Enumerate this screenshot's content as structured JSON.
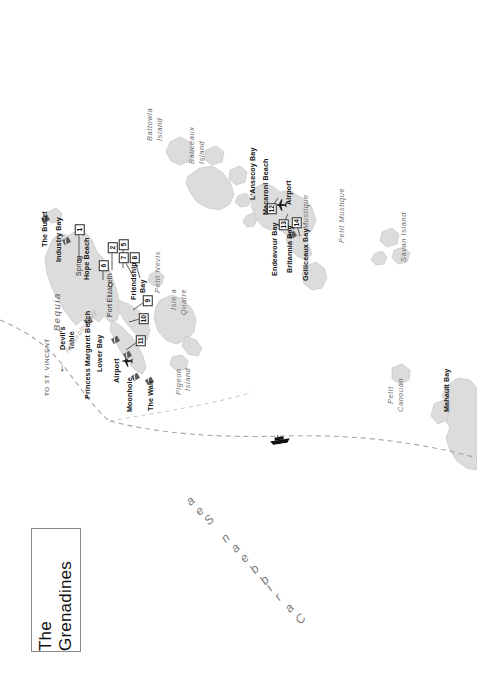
{
  "document": {
    "type": "tourist-map",
    "title": "The Grenadines",
    "orientation_note": "map rendered rotated 90 degrees counter-clockwise"
  },
  "title_box": {
    "label": "The Grenadines"
  },
  "ocean_label": {
    "text": "Caribbean Sea"
  },
  "route": {
    "direction_label": "TO ST. VINCENT",
    "arrow_icon": "arrow-left-icon",
    "ferry_icon": "ferry-boat-icon",
    "line_style": "dashed"
  },
  "islands": [
    {
      "id": "bequia",
      "name": "Bequia",
      "style": "large-italic"
    },
    {
      "id": "battowia",
      "name": "Battowia\nIsland",
      "style": "italic"
    },
    {
      "id": "baliceaux",
      "name": "Baliceaux\nIsland",
      "style": "italic"
    },
    {
      "id": "mustique",
      "name": "Mustique",
      "style": "italic"
    },
    {
      "id": "petit-mustique",
      "name": "Petit Mustique",
      "style": "italic"
    },
    {
      "id": "savan",
      "name": "Savan Island",
      "style": "italic"
    },
    {
      "id": "petit-canouan",
      "name": "Petit\nCanouan",
      "style": "italic"
    },
    {
      "id": "petit-nevis",
      "name": "Petit Nevis",
      "style": "italic"
    },
    {
      "id": "isle-a-quatre",
      "name": "Isle a\nQuatre",
      "style": "italic"
    },
    {
      "id": "pigeon-island",
      "name": "Pigeon\nIsland",
      "style": "italic"
    }
  ],
  "bays": [
    {
      "id": "admiralty-bay",
      "name": "Admiralty Bay"
    }
  ],
  "places": [
    {
      "id": "port-elizabeth",
      "name": "Port Elizabeth",
      "marker": "town-circle"
    },
    {
      "id": "spring",
      "name": "Spring",
      "marker": "town-circle"
    }
  ],
  "dive_sites": [
    {
      "id": "the-bullet",
      "name": "The Bullet",
      "icon": "dive-flag-icon"
    },
    {
      "id": "industry-bay",
      "name": "Industry Bay",
      "icon": "dive-flag-icon"
    },
    {
      "id": "devils-table",
      "name": "Devil's Table",
      "icon": "dive-flag-icon"
    },
    {
      "id": "princess-margaret-beach",
      "name": "Princess Margaret Beach",
      "icon": "dive-flag-icon"
    },
    {
      "id": "lower-bay",
      "name": "Lower Bay",
      "icon": "dive-flag-icon"
    },
    {
      "id": "moonhole",
      "name": "Moonhole",
      "icon": "dive-flag-icon"
    },
    {
      "id": "the-wall",
      "name": "The Wall",
      "icon": "dive-flag-icon"
    },
    {
      "id": "hope-beach",
      "name": "Hope Beach",
      "icon": "none"
    },
    {
      "id": "friendship-bay",
      "name": "Friendship\nBay",
      "icon": "none"
    },
    {
      "id": "lanse-coy-bay",
      "name": "L'Ansecoy Bay",
      "icon": "none"
    },
    {
      "id": "macaroni-beach",
      "name": "Macaroni Beach",
      "icon": "none"
    },
    {
      "id": "endeavour-bay",
      "name": "Endeavour Bay",
      "icon": "none"
    },
    {
      "id": "britannia-bay",
      "name": "Britannia Bay",
      "icon": "none"
    },
    {
      "id": "gelliceaux-bay",
      "name": "Gelliceaux Bay",
      "icon": "none"
    },
    {
      "id": "mahault-bay",
      "name": "Mahault Bay",
      "icon": "none"
    }
  ],
  "airports": [
    {
      "id": "bequia-airport",
      "name": "Airport",
      "icon": "airplane-icon"
    },
    {
      "id": "mustique-airport",
      "name": "Airport",
      "icon": "airplane-icon"
    }
  ],
  "numbered_markers": [
    {
      "n": "1",
      "near": "hope-beach"
    },
    {
      "n": "2",
      "near": "port-elizabeth"
    },
    {
      "n": "5",
      "near": "port-elizabeth"
    },
    {
      "n": "6",
      "near": "port-elizabeth"
    },
    {
      "n": "7",
      "near": "friendship-bay"
    },
    {
      "n": "8",
      "near": "friendship-bay"
    },
    {
      "n": "9",
      "near": "lower-bay"
    },
    {
      "n": "10",
      "near": "lower-bay"
    },
    {
      "n": "11",
      "near": "bequia-airport"
    },
    {
      "n": "12",
      "near": "endeavour-bay"
    },
    {
      "n": "13",
      "near": "britannia-bay"
    },
    {
      "n": "14",
      "near": "gelliceaux-bay"
    }
  ],
  "colors": {
    "land": "#dcdcdc",
    "land_edge": "#c2c2c2",
    "text": "#131313",
    "island_label": "#6f6f6f",
    "sea_label": "#7c7c7c",
    "route": "#9a9a9a",
    "background": "#ffffff"
  }
}
